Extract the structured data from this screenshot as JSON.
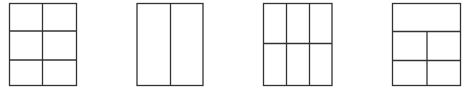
{
  "stroke_color": "#333333",
  "layouts": [
    {
      "name": "grid-2x3",
      "columns": 2,
      "rows": 3
    },
    {
      "name": "two-columns",
      "columns": 2,
      "rows": 1
    },
    {
      "name": "grid-3x2",
      "columns": 3,
      "rows": 2
    },
    {
      "name": "header-plus-2x2",
      "columns": 2,
      "rows": 3,
      "header": true
    }
  ]
}
